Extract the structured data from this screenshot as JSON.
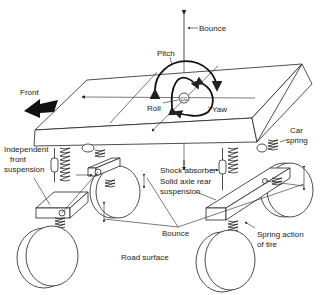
{
  "diagram": {
    "center_label": "CG",
    "motions": {
      "bounce_top": "Bounce",
      "pitch": "Pitch",
      "roll": "Roll",
      "yaw": "Yaw",
      "bounce_bottom": "Bounce"
    },
    "labels": {
      "front": "Front",
      "car_spring_line1": "Car",
      "car_spring_line2": "spring",
      "independent_front_line1": "Independent",
      "independent_front_line2": "front",
      "independent_front_line3": "suspension",
      "shock_absorber": "Shock absorber",
      "solid_axle_line1": "Solid axle rear",
      "solid_axle_line2": "suspension",
      "spring_action_line1": "Spring action",
      "spring_action_line2": "of tire",
      "road_surface": "Road surface"
    },
    "colors": {
      "ink": "#222222",
      "background": "#ffffff"
    }
  }
}
